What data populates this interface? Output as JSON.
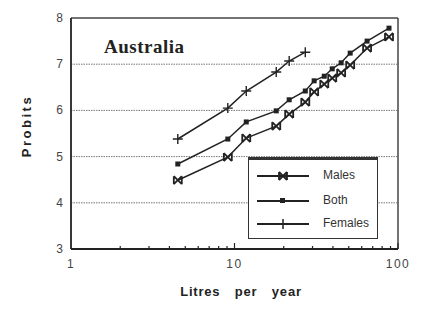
{
  "chart_data": {
    "type": "line",
    "title": "Australia",
    "xlabel": "Litres   per   year",
    "ylabel": "Probits",
    "xscale": "log",
    "xlim": [
      1,
      100
    ],
    "ylim": [
      3,
      8
    ],
    "x_ticks": [
      "1",
      "10",
      "100"
    ],
    "y_ticks": [
      "3",
      "4",
      "5",
      "6",
      "7",
      "8"
    ],
    "grid": "horizontal dotted at y=4,5,6,7",
    "legend_position": "lower right inside plot",
    "series": [
      {
        "name": "Males",
        "marker": "x-box",
        "x": [
          4.5,
          9.1,
          11.8,
          18.0,
          21.6,
          27.1,
          30.7,
          35.4,
          39.6,
          44.9,
          51.0,
          64.7,
          88.1
        ],
        "y": [
          4.49,
          4.99,
          5.4,
          5.66,
          5.92,
          6.18,
          6.4,
          6.57,
          6.7,
          6.81,
          6.98,
          7.35,
          7.59
        ]
      },
      {
        "name": "Both",
        "marker": "square",
        "x": [
          4.5,
          9.1,
          11.8,
          18.0,
          21.6,
          27.1,
          30.7,
          35.4,
          39.6,
          44.9,
          51.0,
          64.7,
          88.1
        ],
        "y": [
          4.84,
          5.38,
          5.75,
          5.99,
          6.23,
          6.42,
          6.64,
          6.74,
          6.9,
          7.03,
          7.24,
          7.5,
          7.78
        ]
      },
      {
        "name": "Females",
        "marker": "plus",
        "x": [
          4.5,
          9.1,
          11.8,
          18.0,
          21.6,
          27.1
        ],
        "y": [
          5.38,
          6.05,
          6.42,
          6.83,
          7.07,
          7.26
        ]
      }
    ]
  },
  "labels": {
    "title": "Australia",
    "xlabel": "Litres   per   year",
    "ylabel": "Probits",
    "legend": [
      "Males",
      "Both",
      "Females"
    ]
  }
}
